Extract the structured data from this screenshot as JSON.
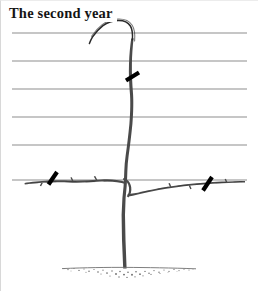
{
  "figure": {
    "title": "The second year",
    "background_color": "#ffffff",
    "ink_color": "#2b2b2b",
    "wire_color": "#8d8d8d",
    "prune_mark_color": "#000000",
    "soil_color": "#6b6b6b"
  },
  "trellis": {
    "label": "training-wires",
    "count": 6,
    "wire_x_start": 12,
    "wire_x_end": 247,
    "wire_y_positions": [
      33,
      61,
      89,
      117,
      145,
      180
    ],
    "stroke_width": 1
  },
  "plant": {
    "label": "trained-tree",
    "trunk": {
      "name": "central-leader",
      "base_x": 126,
      "base_y": 268,
      "top_x": 131,
      "top_y": 36
    },
    "leader_tip": {
      "name": "bent-growing-tip",
      "description": "curved tip bending left above the top wire",
      "tip_x": 92,
      "tip_y": 44
    },
    "branches": [
      {
        "name": "left-lateral-branch",
        "side": "left",
        "origin_x": 126,
        "origin_y": 184,
        "end_x": 25,
        "end_y": 181
      },
      {
        "name": "right-lateral-branch",
        "side": "right",
        "origin_x": 128,
        "origin_y": 196,
        "end_x": 245,
        "end_y": 181
      }
    ]
  },
  "pruning_marks": [
    {
      "name": "prune-mark-leader",
      "location": "central-leader below second wire",
      "x1": 126,
      "y1": 80,
      "x2": 139,
      "y2": 72
    },
    {
      "name": "prune-mark-left-branch",
      "location": "left lateral branch",
      "x1": 48,
      "y1": 184,
      "x2": 57,
      "y2": 172
    },
    {
      "name": "prune-mark-right-branch",
      "location": "right lateral branch",
      "x1": 203,
      "y1": 190,
      "x2": 212,
      "y2": 177
    }
  ],
  "ground": {
    "name": "soil-line",
    "line_y": 268,
    "line_x_start": 60,
    "line_x_end": 198,
    "texture": "stippled-soil"
  }
}
